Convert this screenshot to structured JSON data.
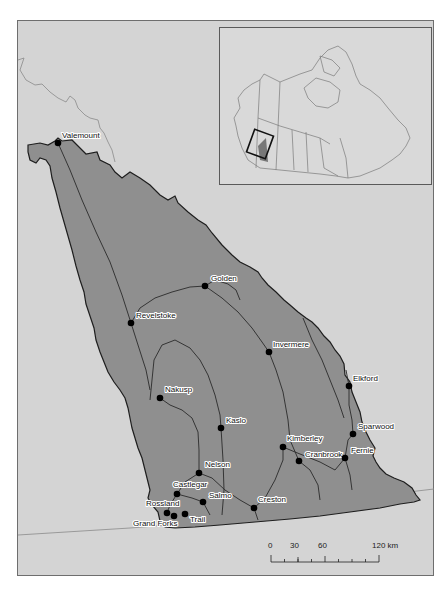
{
  "map": {
    "region": "Columbia Basin, British Columbia",
    "colors": {
      "background": "#d4d4d4",
      "basin_fill": "#8f8f8f",
      "basin_outline": "#1e1e1e",
      "rivers": "#2a2a2a",
      "border_line": "#8a8a8a",
      "town_marker": "#000000"
    },
    "towns": [
      {
        "name": "Valemount",
        "x": 58,
        "y": 143,
        "lx": 62,
        "ly": 138
      },
      {
        "name": "Golden",
        "x": 205,
        "y": 286,
        "lx": 211,
        "ly": 281
      },
      {
        "name": "Revelstoke",
        "x": 131,
        "y": 323,
        "lx": 136,
        "ly": 318
      },
      {
        "name": "Invermere",
        "x": 269,
        "y": 352,
        "lx": 273,
        "ly": 347
      },
      {
        "name": "Elkford",
        "x": 349,
        "y": 386,
        "lx": 353,
        "ly": 381
      },
      {
        "name": "Nakusp",
        "x": 160,
        "y": 398,
        "lx": 165,
        "ly": 392
      },
      {
        "name": "Kaslo",
        "x": 221,
        "y": 428,
        "lx": 226,
        "ly": 423
      },
      {
        "name": "Sparwood",
        "x": 353,
        "y": 434,
        "lx": 358,
        "ly": 429
      },
      {
        "name": "Kimberley",
        "x": 283,
        "y": 447,
        "lx": 287,
        "ly": 441
      },
      {
        "name": "Cranbrook",
        "x": 299,
        "y": 461,
        "lx": 305,
        "ly": 457
      },
      {
        "name": "Fernie",
        "x": 345,
        "y": 458,
        "lx": 351,
        "ly": 453
      },
      {
        "name": "Nelson",
        "x": 199,
        "y": 473,
        "lx": 205,
        "ly": 467
      },
      {
        "name": "Castlegar",
        "x": 177,
        "y": 494,
        "lx": 173,
        "ly": 487
      },
      {
        "name": "Salmo",
        "x": 203,
        "y": 502,
        "lx": 209,
        "ly": 498
      },
      {
        "name": "Creston",
        "x": 254,
        "y": 508,
        "lx": 258,
        "ly": 502
      },
      {
        "name": "Rossland",
        "x": 167,
        "y": 513,
        "lx": 146,
        "ly": 506
      },
      {
        "name": "Grand Forks",
        "x": 174,
        "y": 516,
        "lx": 133,
        "ly": 526
      },
      {
        "name": "Trail",
        "x": 185,
        "y": 514,
        "lx": 190,
        "ly": 522
      }
    ],
    "inset": {
      "title": "Canada locator",
      "highlight_label": "study area"
    },
    "scale_bar": {
      "ticks": [
        "0",
        "30",
        "60",
        "120 km"
      ],
      "unit": "km"
    }
  }
}
